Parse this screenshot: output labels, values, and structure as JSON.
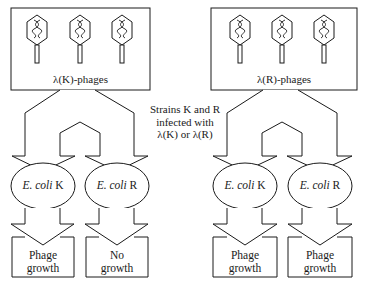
{
  "diagram": {
    "colors": {
      "stroke": "#1a1a1a",
      "background": "#ffffff"
    },
    "left_panel": {
      "source_label": "λ(K)-phages",
      "phage_count": 3,
      "hosts": [
        {
          "species": "E. coli",
          "strain": "K",
          "outcome": [
            "Phage",
            "growth"
          ]
        },
        {
          "species": "E. coli",
          "strain": "R",
          "outcome": [
            "No",
            "growth"
          ]
        }
      ]
    },
    "right_panel": {
      "source_label": "λ(R)-phages",
      "phage_count": 3,
      "hosts": [
        {
          "species": "E. coli",
          "strain": "K",
          "outcome": [
            "Phage",
            "growth"
          ]
        },
        {
          "species": "E. coli",
          "strain": "R",
          "outcome": [
            "Phage",
            "growth"
          ]
        }
      ]
    },
    "center_caption": [
      "Strains K and R",
      "infected with",
      "λ(K) or λ(R)"
    ],
    "icons": {
      "phage": "bacteriophage-icon"
    }
  }
}
